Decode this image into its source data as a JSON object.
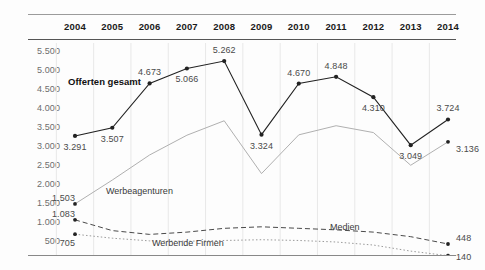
{
  "chart_data": {
    "type": "line",
    "title": "",
    "xlabel": "",
    "ylabel": "",
    "grid": "vertical",
    "legend_position": "inline-annotations",
    "categories": [
      "2004",
      "2005",
      "2006",
      "2007",
      "2008",
      "2009",
      "2010",
      "2011",
      "2012",
      "2013",
      "2014"
    ],
    "ylim": [
      0,
      5750
    ],
    "yticks": [
      500,
      1000,
      1500,
      2000,
      2500,
      3000,
      3500,
      4000,
      4500,
      5000,
      5500
    ],
    "ytick_labels": [
      "500",
      "1.000",
      "1.500",
      "2.000",
      "2.500",
      "3.000",
      "3.500",
      "4.000",
      "4.500",
      "5.000",
      "5.500"
    ],
    "series": [
      {
        "name": "Offerten gesamt",
        "style": "solid",
        "color": "#222222",
        "markers": true,
        "values": [
          3291,
          3507,
          4673,
          5066,
          5262,
          3324,
          4670,
          4848,
          4310,
          3049,
          3724
        ],
        "labels": [
          "3.291",
          "3.507",
          "4.673",
          "5.066",
          "5.262",
          "3.324",
          "4.670",
          "4.848",
          "4.310",
          "3.049",
          "3.724"
        ]
      },
      {
        "name": "Werbeagenturen",
        "style": "solid",
        "color": "#b0b0b0",
        "markers": false,
        "values": [
          1503,
          2130,
          2790,
          3310,
          3690,
          2300,
          3320,
          3560,
          3380,
          2520,
          3136
        ],
        "labels": [
          "1.503",
          "",
          "",
          "",
          "",
          "",
          "",
          "",
          "",
          "",
          "3.136"
        ]
      },
      {
        "name": "Medien",
        "style": "dashed",
        "color": "#4a4a4a",
        "markers": false,
        "values": [
          1083,
          800,
          700,
          760,
          860,
          900,
          860,
          820,
          760,
          640,
          448
        ],
        "labels": [
          "1.083",
          "",
          "",
          "",
          "",
          "",
          "",
          "",
          "",
          "",
          "448"
        ]
      },
      {
        "name": "Werbende Firmen",
        "style": "dotted",
        "color": "#9a9a9a",
        "markers": false,
        "values": [
          705,
          600,
          530,
          520,
          540,
          560,
          540,
          500,
          420,
          260,
          140
        ],
        "labels": [
          "705",
          "",
          "",
          "",
          "",
          "",
          "",
          "",
          "",
          "",
          "140"
        ]
      }
    ],
    "annotations": [
      {
        "text": "Offerten gesamt",
        "series": "Offerten gesamt"
      },
      {
        "text": "Werbeagenturen",
        "series": "Werbeagenturen"
      },
      {
        "text": "Medien",
        "series": "Medien"
      },
      {
        "text": "Werbende Firmen",
        "series": "Werbende Firmen"
      }
    ]
  }
}
